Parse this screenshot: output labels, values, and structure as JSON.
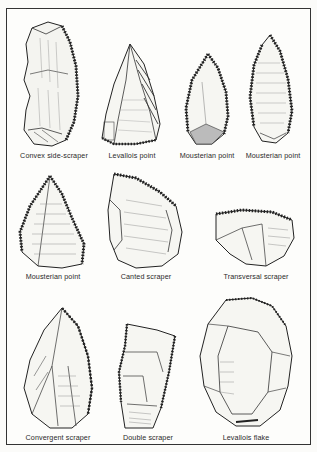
{
  "figure": {
    "title": "",
    "colors": {
      "ink": "#222222",
      "paper": "#fdfdfb",
      "border": "#333333"
    },
    "rows": [
      {
        "items": [
          {
            "name": "convex-side-scraper",
            "label": "Convex side-scraper"
          },
          {
            "name": "levallois-point",
            "label": "Levallois point"
          },
          {
            "name": "mousterian-point-1",
            "label": "Mousterian point"
          },
          {
            "name": "mousterian-point-2",
            "label": "Mousterian point"
          }
        ]
      },
      {
        "items": [
          {
            "name": "mousterian-point-3",
            "label": "Mousterian point"
          },
          {
            "name": "canted-scraper",
            "label": "Canted scraper"
          },
          {
            "name": "transversal-scraper",
            "label": "Transversal scraper"
          }
        ]
      },
      {
        "items": [
          {
            "name": "convergent-scraper",
            "label": "Convergent scraper"
          },
          {
            "name": "double-scraper",
            "label": "Double scraper"
          },
          {
            "name": "levallois-flake",
            "label": "Levallois flake"
          }
        ]
      }
    ]
  }
}
